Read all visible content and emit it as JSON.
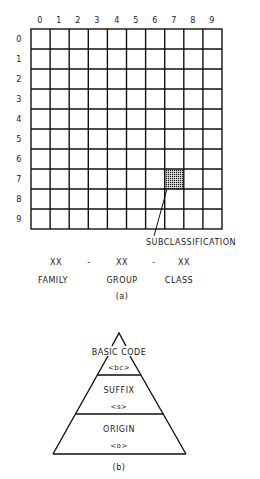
{
  "part_a": {
    "column_labels": [
      "0",
      "1",
      "2",
      "3",
      "4",
      "5",
      "6",
      "7",
      "8",
      "9"
    ],
    "row_labels": [
      "0",
      "1",
      "2",
      "3",
      "4",
      "5",
      "6",
      "7",
      "8",
      "9"
    ],
    "highlighted_cell": {
      "row": 7,
      "col": 7
    },
    "callout": "SUBCLASSIFICATION",
    "code_format": {
      "family_code": "XX",
      "sep1": "-",
      "group_code": "XX",
      "sep2": "-",
      "class_code": "XX"
    },
    "code_labels": {
      "family": "FAMILY",
      "group": "GROUP",
      "class": "CLASS"
    },
    "caption": "(a)"
  },
  "part_b": {
    "layers": [
      {
        "name": "BASIC CODE",
        "symbol": "<bc>"
      },
      {
        "name": "SUFFIX",
        "symbol": "<s>"
      },
      {
        "name": "ORIGIN",
        "symbol": "<o>"
      }
    ],
    "caption": "(b)"
  },
  "colors": {
    "ink": "#111111",
    "background": "#ffffff",
    "shade": "#2a2a2a"
  }
}
